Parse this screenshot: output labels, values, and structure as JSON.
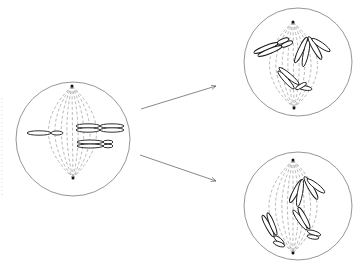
{
  "diagram": {
    "title": "",
    "colors": {
      "background": "#ffffff",
      "cell_outline": "#8a8a8a",
      "spindle": "#9a9a9a",
      "chromosome_stroke": "#1a1a1a",
      "arrow": "#6a6a6a",
      "pole": "#111111"
    },
    "cells": [
      {
        "id": "parent-cell",
        "center": [
          73,
          139
        ],
        "radius": 57,
        "poles": [
          [
            72,
            86
          ],
          [
            73,
            178
          ]
        ],
        "chromosomes": [
          {
            "arms": [
              [
                39,
                133,
                12,
                2.2,
                0
              ],
              [
                57,
                133,
                6,
                2.0,
                0
              ]
            ]
          },
          {
            "arms": [
              [
                88,
                126,
                12,
                2.2,
                0
              ],
              [
                112,
                126,
                12,
                2.2,
                0
              ]
            ]
          },
          {
            "arms": [
              [
                88,
                130,
                12,
                2.2,
                0
              ],
              [
                112,
                130,
                12,
                2.2,
                0
              ]
            ]
          },
          {
            "arms": [
              [
                90,
                142,
                13,
                2.0,
                0
              ],
              [
                108,
                142,
                5,
                1.8,
                0
              ]
            ]
          },
          {
            "arms": [
              [
                90,
                146,
                13,
                2.0,
                0
              ],
              [
                108,
                146,
                5,
                1.8,
                0
              ]
            ]
          }
        ]
      },
      {
        "id": "daughter-outcome-top",
        "center": [
          298,
          62
        ],
        "radius": 54,
        "poles": [
          [
            293,
            22
          ],
          [
            294,
            108
          ]
        ],
        "chromosomes": [
          {
            "arms": [
              [
                266,
                48,
                13,
                2.4,
                -22
              ],
              [
                283,
                41,
                6,
                2.2,
                -22
              ]
            ]
          },
          {
            "arms": [
              [
                270,
                51,
                13,
                2.4,
                -22
              ],
              [
                287,
                44,
                6,
                2.2,
                -22
              ]
            ]
          },
          {
            "arms": [
              [
                301,
                50,
                14,
                2.6,
                -65
              ]
            ]
          },
          {
            "arms": [
              [
                306,
                53,
                14,
                2.6,
                -78
              ]
            ]
          },
          {
            "arms": [
              [
                315,
                48,
                13,
                2.6,
                60
              ]
            ]
          },
          {
            "arms": [
              [
                321,
                45,
                11,
                2.6,
                35
              ]
            ]
          },
          {
            "arms": [
              [
                289,
                76,
                13,
                2.5,
                40
              ]
            ]
          },
          {
            "arms": [
              [
                286,
                80,
                12,
                2.3,
                48
              ]
            ]
          },
          {
            "arms": [
              [
                305,
                88,
                7,
                2.2,
                10
              ]
            ]
          },
          {
            "arms": [
              [
                301,
                86,
                6,
                2.0,
                -30
              ]
            ]
          }
        ]
      },
      {
        "id": "daughter-outcome-bottom",
        "center": [
          298,
          206
        ],
        "radius": 54,
        "poles": [
          [
            293,
            160
          ],
          [
            293,
            253
          ]
        ],
        "chromosomes": [
          {
            "arms": [
              [
                296,
                191,
                13,
                2.6,
                -62
              ]
            ]
          },
          {
            "arms": [
              [
                300,
                193,
                14,
                2.6,
                -80
              ]
            ]
          },
          {
            "arms": [
              [
                311,
                188,
                13,
                2.6,
                60
              ]
            ]
          },
          {
            "arms": [
              [
                316,
                186,
                11,
                2.6,
                38
              ]
            ]
          },
          {
            "arms": [
              [
                268,
                226,
                12,
                2.3,
                62
              ]
            ]
          },
          {
            "arms": [
              [
                272,
                224,
                12,
                2.3,
                68
              ]
            ]
          },
          {
            "arms": [
              [
                279,
                240,
                6,
                2.2,
                38
              ]
            ]
          },
          {
            "arms": [
              [
                279,
                244,
                6,
                2.2,
                20
              ]
            ]
          },
          {
            "arms": [
              [
                300,
                220,
                12,
                2.4,
                55
              ]
            ]
          },
          {
            "arms": [
              [
                304,
                218,
                12,
                2.4,
                62
              ]
            ]
          },
          {
            "arms": [
              [
                314,
                233,
                7,
                2.2,
                18
              ]
            ]
          },
          {
            "arms": [
              [
                313,
                237,
                6,
                2.0,
                10
              ]
            ]
          }
        ]
      }
    ],
    "arrows": [
      {
        "id": "arrow-to-top",
        "from": [
          141,
          109
        ],
        "to": [
          216,
          86
        ]
      },
      {
        "id": "arrow-to-bottom",
        "from": [
          140,
          155
        ],
        "to": [
          216,
          181
        ]
      }
    ]
  }
}
